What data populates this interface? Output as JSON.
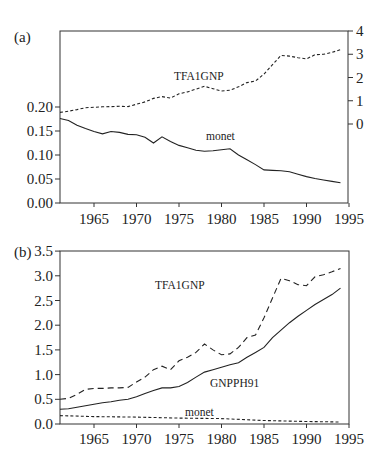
{
  "chart_data": [
    {
      "panel": "(a)",
      "type": "line",
      "title": "",
      "xlabel": "",
      "ylabel": "",
      "xlim": [
        1961,
        1995
      ],
      "x_ticks": [
        1965,
        1970,
        1975,
        1980,
        1985,
        1990,
        1995
      ],
      "y_left": {
        "range": [
          0.0,
          0.2
        ],
        "ticks": [
          "0.00",
          "0.05",
          "0.10",
          "0.15",
          "0.20"
        ]
      },
      "y_right": {
        "range": [
          0,
          4
        ],
        "ticks": [
          "0",
          "1",
          "2",
          "3",
          "4"
        ]
      },
      "grid": false,
      "series": [
        {
          "name": "TFA1GNP",
          "axis": "right",
          "style": "dashed",
          "x": [
            1961,
            1962,
            1963,
            1964,
            1965,
            1966,
            1967,
            1968,
            1969,
            1970,
            1971,
            1972,
            1973,
            1974,
            1975,
            1976,
            1977,
            1978,
            1979,
            1980,
            1981,
            1982,
            1983,
            1984,
            1985,
            1986,
            1987,
            1988,
            1989,
            1990,
            1991,
            1992,
            1993,
            1994
          ],
          "values": [
            0.5,
            0.55,
            0.62,
            0.7,
            0.72,
            0.74,
            0.75,
            0.76,
            0.75,
            0.85,
            0.95,
            1.1,
            1.18,
            1.12,
            1.3,
            1.38,
            1.5,
            1.62,
            1.52,
            1.42,
            1.45,
            1.6,
            1.78,
            1.85,
            2.15,
            2.55,
            2.95,
            2.92,
            2.85,
            2.8,
            2.98,
            3.0,
            3.08,
            3.2
          ]
        },
        {
          "name": "monet",
          "axis": "left",
          "style": "solid",
          "x": [
            1961,
            1962,
            1963,
            1964,
            1965,
            1966,
            1967,
            1968,
            1969,
            1970,
            1971,
            1972,
            1973,
            1974,
            1975,
            1976,
            1977,
            1978,
            1979,
            1980,
            1981,
            1982,
            1983,
            1984,
            1985,
            1986,
            1987,
            1988,
            1989,
            1990,
            1991,
            1992,
            1993,
            1994
          ],
          "values": [
            0.176,
            0.172,
            0.162,
            0.155,
            0.149,
            0.144,
            0.149,
            0.147,
            0.143,
            0.142,
            0.137,
            0.125,
            0.138,
            0.128,
            0.12,
            0.115,
            0.11,
            0.108,
            0.109,
            0.111,
            0.113,
            0.1,
            0.09,
            0.08,
            0.069,
            0.068,
            0.067,
            0.065,
            0.06,
            0.055,
            0.051,
            0.048,
            0.045,
            0.042
          ]
        }
      ]
    },
    {
      "panel": "(b)",
      "type": "line",
      "title": "",
      "xlabel": "",
      "ylabel": "",
      "xlim": [
        1961,
        1995
      ],
      "ylim": [
        0.0,
        3.5
      ],
      "x_ticks": [
        1965,
        1970,
        1975,
        1980,
        1985,
        1990,
        1995
      ],
      "y_ticks": [
        "0.0",
        "0.5",
        "1.0",
        "1.5",
        "2.0",
        "2.5",
        "3.0",
        "3.5"
      ],
      "grid": false,
      "series": [
        {
          "name": "TFA1GNP",
          "style": "dashed",
          "x": [
            1961,
            1962,
            1963,
            1964,
            1965,
            1966,
            1967,
            1968,
            1969,
            1970,
            1971,
            1972,
            1973,
            1974,
            1975,
            1976,
            1977,
            1978,
            1979,
            1980,
            1981,
            1982,
            1983,
            1984,
            1985,
            1986,
            1987,
            1988,
            1989,
            1990,
            1991,
            1992,
            1993,
            1994
          ],
          "values": [
            0.5,
            0.52,
            0.6,
            0.7,
            0.72,
            0.72,
            0.73,
            0.73,
            0.74,
            0.85,
            0.95,
            1.1,
            1.17,
            1.1,
            1.28,
            1.35,
            1.45,
            1.62,
            1.5,
            1.4,
            1.42,
            1.55,
            1.75,
            1.8,
            2.15,
            2.55,
            2.95,
            2.9,
            2.82,
            2.8,
            2.98,
            3.02,
            3.08,
            3.15
          ]
        },
        {
          "name": "GNPPH91",
          "style": "solid",
          "x": [
            1961,
            1962,
            1963,
            1964,
            1965,
            1966,
            1967,
            1968,
            1969,
            1970,
            1971,
            1972,
            1973,
            1974,
            1975,
            1976,
            1977,
            1978,
            1979,
            1980,
            1981,
            1982,
            1983,
            1984,
            1985,
            1986,
            1987,
            1988,
            1989,
            1990,
            1991,
            1992,
            1993,
            1994
          ],
          "values": [
            0.3,
            0.31,
            0.34,
            0.37,
            0.4,
            0.43,
            0.45,
            0.48,
            0.5,
            0.55,
            0.62,
            0.68,
            0.73,
            0.73,
            0.76,
            0.84,
            0.95,
            1.05,
            1.1,
            1.15,
            1.2,
            1.24,
            1.35,
            1.45,
            1.55,
            1.75,
            1.9,
            2.05,
            2.18,
            2.3,
            2.42,
            2.52,
            2.62,
            2.75
          ]
        },
        {
          "name": "monet",
          "style": "dashed-fine",
          "x": [
            1961,
            1965,
            1970,
            1975,
            1980,
            1985,
            1990,
            1994
          ],
          "values": [
            0.17,
            0.15,
            0.14,
            0.12,
            0.11,
            0.07,
            0.05,
            0.04
          ]
        }
      ]
    }
  ],
  "labels": {
    "panel_a": "(a)",
    "panel_b": "(b)",
    "a_tfa": "TFA1GNP",
    "a_monet": "monet",
    "b_tfa": "TFA1GNP",
    "b_gnp": "GNPPH91",
    "b_monet": "monet"
  }
}
